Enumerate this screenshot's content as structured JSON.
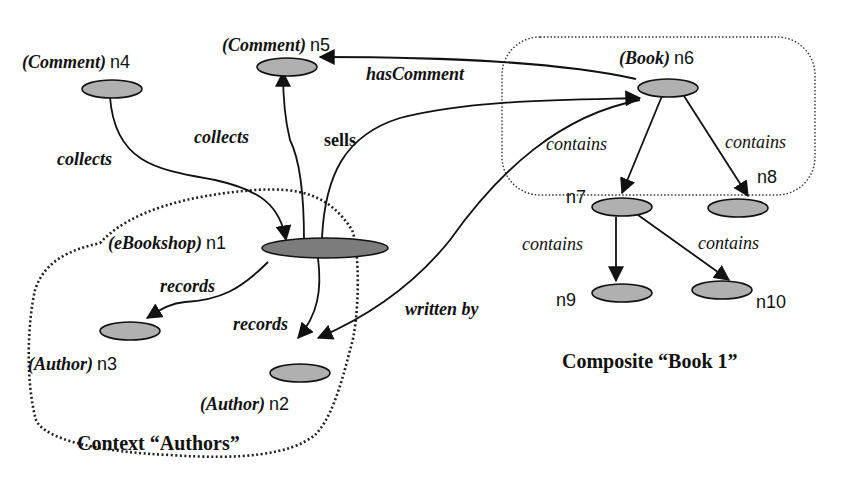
{
  "nodes": {
    "n1": {
      "type": "(eBookshop)",
      "id": "n1"
    },
    "n2": {
      "type": "(Author)",
      "id": "n2"
    },
    "n3": {
      "type": "(Author)",
      "id": "n3"
    },
    "n4": {
      "type": "(Comment)",
      "id": "n4"
    },
    "n5": {
      "type": "(Comment)",
      "id": "n5"
    },
    "n6": {
      "type": "(Book)",
      "id": "n6"
    },
    "n7": {
      "id": "n7"
    },
    "n8": {
      "id": "n8"
    },
    "n9": {
      "id": "n9"
    },
    "n10": {
      "id": "n10"
    }
  },
  "edges": {
    "n4_n1": "collects",
    "n1_n5": "collects",
    "n1_n6": "sells",
    "n6_n5": "hasComment",
    "n1_n3": "records",
    "n1_n2": "records",
    "n6_n2": "written by",
    "n6_n7": "contains",
    "n6_n8": "contains",
    "n7_n9": "contains",
    "n7_n10": "contains"
  },
  "regions": {
    "context": "Context “Authors”",
    "composite": "Composite “Book 1”"
  },
  "colors": {
    "node_fill": "#b0b0b0",
    "hub_fill": "#7a7a7a",
    "stroke": "#111111"
  }
}
